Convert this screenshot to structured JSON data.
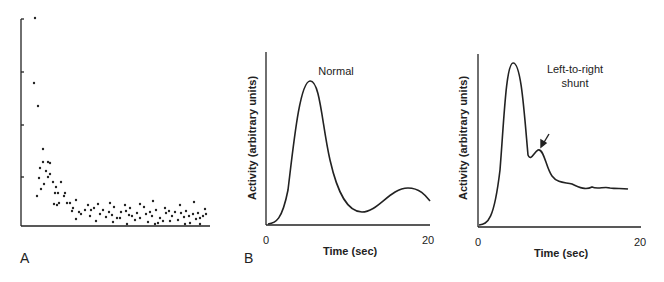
{
  "panels": {
    "A": {
      "letter": "A"
    },
    "B": {
      "letter": "B",
      "title": "Normal",
      "xlabel": "Time (sec)",
      "ylabel": "Activity (arbitrary units)",
      "xtick_start": "0",
      "xtick_end": "20"
    },
    "C": {
      "title_line1": "Left-to-right",
      "title_line2": "shunt",
      "xlabel": "Time (sec)",
      "ylabel": "Activity (arbitrary units)",
      "xtick_start": "0",
      "xtick_end": "20"
    }
  },
  "chart_data": [
    {
      "type": "scatter",
      "panel": "A",
      "title": "",
      "xlabel": "",
      "ylabel": "",
      "grid": false,
      "yticks_count": 4,
      "description": "Points decay exponentially from high initial values toward a noisy low plateau",
      "points_px": [
        [
          35,
          18
        ],
        [
          34,
          83
        ],
        [
          38,
          106
        ],
        [
          43,
          149
        ],
        [
          43,
          162
        ],
        [
          40,
          168
        ],
        [
          48,
          162
        ],
        [
          39,
          178
        ],
        [
          46,
          171
        ],
        [
          50,
          174
        ],
        [
          44,
          184
        ],
        [
          37,
          196
        ],
        [
          41,
          189
        ],
        [
          50,
          163
        ],
        [
          48,
          177
        ],
        [
          53,
          182
        ],
        [
          61,
          182
        ],
        [
          56,
          187
        ],
        [
          55,
          193
        ],
        [
          58,
          193
        ],
        [
          65,
          193
        ],
        [
          59,
          203
        ],
        [
          67,
          203
        ],
        [
          64,
          196
        ],
        [
          54,
          204
        ],
        [
          57,
          205
        ],
        [
          70,
          203
        ],
        [
          73,
          208
        ],
        [
          76,
          200
        ],
        [
          72,
          211
        ],
        [
          79,
          212
        ],
        [
          76,
          219
        ],
        [
          81,
          214
        ],
        [
          88,
          205
        ],
        [
          85,
          210
        ],
        [
          91,
          210
        ],
        [
          94,
          208
        ],
        [
          90,
          216
        ],
        [
          96,
          221
        ],
        [
          98,
          204
        ],
        [
          100,
          214
        ],
        [
          103,
          210
        ],
        [
          106,
          217
        ],
        [
          109,
          212
        ],
        [
          112,
          215
        ],
        [
          114,
          207
        ],
        [
          117,
          218
        ],
        [
          121,
          212
        ],
        [
          126,
          211
        ],
        [
          129,
          215
        ],
        [
          132,
          216
        ],
        [
          130,
          208
        ],
        [
          137,
          213
        ],
        [
          140,
          218
        ],
        [
          144,
          207
        ],
        [
          146,
          214
        ],
        [
          150,
          212
        ],
        [
          152,
          216
        ],
        [
          156,
          210
        ],
        [
          160,
          218
        ],
        [
          163,
          221
        ],
        [
          166,
          213
        ],
        [
          169,
          211
        ],
        [
          172,
          216
        ],
        [
          175,
          212
        ],
        [
          178,
          220
        ],
        [
          181,
          213
        ],
        [
          184,
          217
        ],
        [
          186,
          211
        ],
        [
          189,
          216
        ],
        [
          193,
          214
        ],
        [
          196,
          219
        ],
        [
          198,
          213
        ],
        [
          200,
          218
        ],
        [
          203,
          216
        ],
        [
          206,
          214
        ],
        [
          120,
          218
        ],
        [
          135,
          220
        ],
        [
          148,
          222
        ],
        [
          158,
          223
        ],
        [
          170,
          221
        ],
        [
          190,
          223
        ],
        [
          200,
          224
        ],
        [
          110,
          203
        ],
        [
          125,
          205
        ],
        [
          140,
          204
        ],
        [
          153,
          201
        ],
        [
          165,
          208
        ],
        [
          180,
          205
        ],
        [
          194,
          202
        ],
        [
          205,
          209
        ],
        [
          113,
          222
        ],
        [
          127,
          224
        ],
        [
          155,
          224
        ],
        [
          185,
          224
        ]
      ]
    },
    {
      "type": "line",
      "panel": "B",
      "title": "Normal",
      "xlabel": "Time (sec)",
      "ylabel": "Activity (arbitrary units)",
      "xlim": [
        0,
        20
      ],
      "x": [
        0,
        1,
        2,
        3,
        4,
        5,
        6,
        7,
        8,
        9,
        10,
        11,
        12,
        13,
        14,
        15,
        16,
        17,
        18,
        19,
        20
      ],
      "values": [
        0,
        2,
        8,
        35,
        75,
        95,
        84,
        55,
        33,
        20,
        12,
        9,
        8,
        9,
        12,
        17,
        21,
        24,
        24,
        20,
        15
      ]
    },
    {
      "type": "line",
      "panel": "C",
      "title": "Left-to-right shunt",
      "xlabel": "Time (sec)",
      "ylabel": "Activity (arbitrary units)",
      "xlim": [
        0,
        20
      ],
      "annotation": "arrow pointing to secondary early peak (~7 sec)",
      "x": [
        0,
        1,
        2,
        3,
        4,
        5,
        6,
        7,
        8,
        9,
        10,
        11,
        12,
        13,
        14,
        15,
        16,
        17,
        18,
        19
      ],
      "values": [
        0,
        2,
        18,
        80,
        100,
        82,
        42,
        47,
        38,
        27,
        24,
        22,
        20,
        19,
        19,
        19,
        18,
        18,
        18,
        18
      ]
    }
  ]
}
